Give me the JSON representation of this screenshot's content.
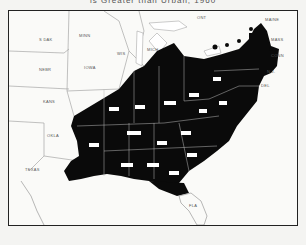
{
  "title": "is Greater than Urban, 1960",
  "colors": {
    "shaded": "#0a0a0a",
    "unshaded": "#fafaf8",
    "border": "#222222",
    "state_line": "#888888"
  },
  "legend_meaning": "Black-shaded states meet the mapped condition",
  "states_unshaded": [
    {
      "abbr": "S DAK"
    },
    {
      "abbr": "MINN"
    },
    {
      "abbr": "NEBR"
    },
    {
      "abbr": "IOWA"
    },
    {
      "abbr": "WIS"
    },
    {
      "abbr": "MICH"
    },
    {
      "abbr": "KANS"
    },
    {
      "abbr": "OKLA"
    },
    {
      "abbr": "TEXAS"
    },
    {
      "abbr": "FLA"
    },
    {
      "abbr": "MAINE"
    },
    {
      "abbr": "MASS"
    },
    {
      "abbr": "CONN"
    },
    {
      "abbr": "N.J."
    },
    {
      "abbr": "DEL"
    }
  ],
  "other_labels": {
    "canada": "ONT"
  }
}
